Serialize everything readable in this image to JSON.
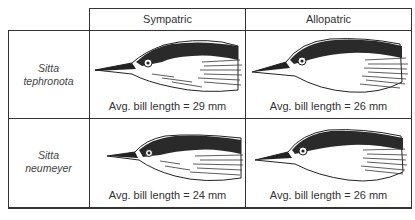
{
  "table": {
    "columns": [
      "Sympatric",
      "Allopatric"
    ],
    "rows": [
      {
        "species_line1": "Sitta",
        "species_line2": "tephronota",
        "cells": [
          {
            "caption": "Avg. bill length = 29 mm",
            "illustration": "nuthatch-head-long-bill"
          },
          {
            "caption": "Avg. bill length = 26 mm",
            "illustration": "nuthatch-head"
          }
        ]
      },
      {
        "species_line1": "Sitta",
        "species_line2": "neumeyer",
        "cells": [
          {
            "caption": "Avg. bill length = 24 mm",
            "illustration": "nuthatch-head-short-bill"
          },
          {
            "caption": "Avg. bill length = 26 mm",
            "illustration": "nuthatch-head"
          }
        ]
      }
    ]
  },
  "colors": {
    "line": "#333333",
    "background": "#ffffff",
    "ink": "#222222"
  }
}
